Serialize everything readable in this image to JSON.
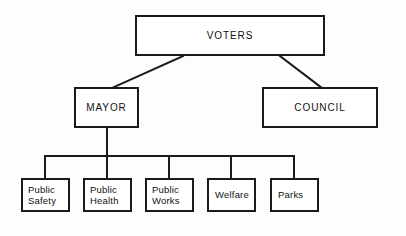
{
  "diagram": {
    "type": "organization-chart",
    "background_color": "#fdfdfd",
    "line_color": "#1a1a1a",
    "text_color": "#111111",
    "nodes": {
      "voters": {
        "label": "VOTERS",
        "level": "top"
      },
      "mayor": {
        "label": "MAYOR",
        "level": "second"
      },
      "council": {
        "label": "COUNCIL",
        "level": "second"
      },
      "departments": [
        {
          "label": "Public\nSafety",
          "lines": [
            "Public",
            "Safety"
          ]
        },
        {
          "label": "Public\nHealth",
          "lines": [
            "Public",
            "Health"
          ]
        },
        {
          "label": "Public\nWorks",
          "lines": [
            "Public",
            "Works"
          ]
        },
        {
          "label": "Welfare",
          "lines": [
            "Welfare"
          ]
        },
        {
          "label": "Parks",
          "lines": [
            "Parks"
          ]
        }
      ]
    },
    "edges": [
      {
        "from": "VOTERS",
        "to": "MAYOR",
        "style": "diagonal"
      },
      {
        "from": "VOTERS",
        "to": "COUNCIL",
        "style": "diagonal"
      },
      {
        "from": "MAYOR",
        "to": "Public Safety",
        "style": "orthogonal"
      },
      {
        "from": "MAYOR",
        "to": "Public Health",
        "style": "orthogonal"
      },
      {
        "from": "MAYOR",
        "to": "Public Works",
        "style": "orthogonal"
      },
      {
        "from": "MAYOR",
        "to": "Welfare",
        "style": "orthogonal"
      },
      {
        "from": "MAYOR",
        "to": "Parks",
        "style": "orthogonal"
      }
    ]
  }
}
